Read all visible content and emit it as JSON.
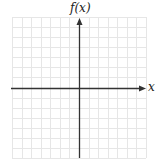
{
  "chart_data": {
    "type": "blank-coordinate-grid",
    "title": "",
    "xlabel": "x",
    "ylabel": "f(x)",
    "grid": true,
    "grid_columns": 14,
    "grid_rows": 14,
    "x_ticks": [],
    "y_ticks": [],
    "series": []
  },
  "axes": {
    "x_label": "x",
    "y_label": "f(x)"
  },
  "colors": {
    "grid": "#e6e6e6",
    "axis": "#333333",
    "background": "#ffffff"
  }
}
